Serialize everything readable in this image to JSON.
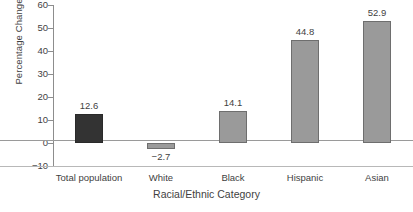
{
  "chart_data": {
    "type": "bar",
    "title": "",
    "xlabel": "Racial/Ethnic Category",
    "ylabel": "Percentage Change",
    "categories": [
      "Total population",
      "White",
      "Black",
      "Hispanic",
      "Asian"
    ],
    "values": [
      12.6,
      -2.7,
      14.1,
      44.8,
      52.9
    ],
    "value_labels": [
      "12.6",
      "−2.7",
      "14.1",
      "44.8",
      "52.9"
    ],
    "ylim": [
      -10,
      60
    ],
    "yticks": [
      60,
      50,
      40,
      30,
      20,
      10,
      0,
      -10
    ],
    "ytick_labels": [
      "60",
      "50",
      "40",
      "30",
      "20",
      "10",
      "0",
      "−10"
    ],
    "grid": false,
    "legend": "none",
    "bar_colors": [
      "#333333",
      "#9a9a9a",
      "#9a9a9a",
      "#9a9a9a",
      "#9a9a9a"
    ],
    "zero_line": 0
  },
  "colors": {
    "dark_bar": "#333333",
    "grey_bar": "#9a9a9a",
    "bar_border": "#6e6e6e",
    "axis": "#8d8d8d",
    "text": "#3f3f3f",
    "background": "#ffffff"
  },
  "caption": ""
}
